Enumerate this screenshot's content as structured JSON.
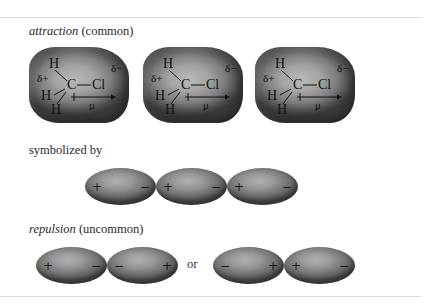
{
  "figure": {
    "sections": {
      "attraction": {
        "label_italic": "attraction",
        "label_rest": " (common)"
      },
      "symbolized": {
        "label": "symbolized by"
      },
      "repulsion": {
        "label_italic": "repulsion",
        "label_rest": " (uncommon)",
        "separator": "or"
      }
    },
    "molecule": {
      "atoms": {
        "h_top": "H",
        "h_mid": "H",
        "h_bot": "H",
        "carbon": "C",
        "chlorine": "Cl"
      },
      "partial_positive": "δ+",
      "partial_negative": "δ−",
      "dipole_symbol": "μ",
      "bond": "—"
    },
    "dipoles": {
      "attraction_row": [
        {
          "left": "+",
          "right": "−"
        },
        {
          "left": "+",
          "right": "−"
        },
        {
          "left": "+",
          "right": "−"
        }
      ],
      "repulsion_row_a": [
        {
          "left": "+",
          "right": "−"
        },
        {
          "left": "−",
          "right": "+"
        }
      ],
      "repulsion_row_b": [
        {
          "left": "−",
          "right": "+"
        },
        {
          "left": "+",
          "right": "−"
        }
      ]
    },
    "colors": {
      "blob_center": "#b8b8b8",
      "blob_edge": "#3a3a3a",
      "rule": "#dcdcdc",
      "text": "#2a2a2a"
    }
  }
}
